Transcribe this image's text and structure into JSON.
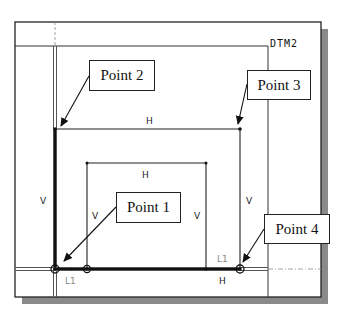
{
  "diagram": {
    "datum_label": "DTM2",
    "dimension_labels": {
      "outer_top_h": "H",
      "inner_top_h": "H",
      "left_v": "V",
      "inner_left_v": "V",
      "inner_right_v": "V",
      "outer_right_v": "V",
      "bottom_h": "H",
      "line_lock_left": "L1",
      "line_lock_right": "L1"
    },
    "callouts": [
      {
        "id": "point-1",
        "label": "Point 1"
      },
      {
        "id": "point-2",
        "label": "Point 2"
      },
      {
        "id": "point-3",
        "label": "Point 3"
      },
      {
        "id": "point-4",
        "label": "Point 4"
      }
    ],
    "colors": {
      "line": "#222222",
      "shadow": "#8a8a8a",
      "background": "#ffffff"
    }
  }
}
